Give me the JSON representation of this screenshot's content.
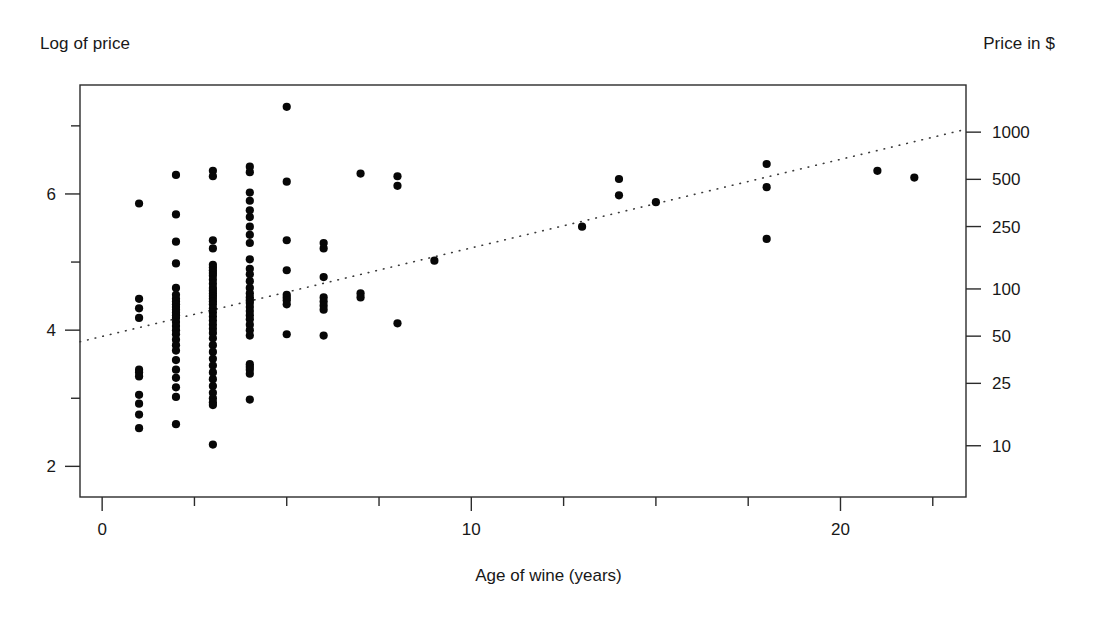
{
  "figure": {
    "left_corner_label": "Log of price",
    "right_corner_label": "Price in $",
    "x_axis_title": "Age of wine (years)"
  },
  "chart_data": {
    "type": "scatter",
    "title": "",
    "subtitle": "",
    "xlabel": "Age of wine (years)",
    "ylabel": "Log of price",
    "y2label": "Price in $",
    "xlim": [
      -0.6,
      23.4
    ],
    "ylim": [
      1.55,
      7.6
    ],
    "grid": false,
    "legend": null,
    "x_ticks": [
      0,
      10,
      20
    ],
    "x_ticklabels": [
      "0",
      "10",
      "20"
    ],
    "x_minor_ticks": [
      2.5,
      5,
      7.5,
      12.5,
      15,
      17.5,
      22.5
    ],
    "y_ticks": [
      2,
      4,
      6
    ],
    "y_ticklabels": [
      "2",
      "4",
      "6"
    ],
    "y_minor_ticks": [
      3,
      5,
      7
    ],
    "y2_ticks": [
      10,
      25,
      50,
      100,
      250,
      500,
      1000
    ],
    "y2_ticklabels": [
      "10",
      "25",
      "50",
      "100",
      "250",
      "500",
      "1000"
    ],
    "series": [
      {
        "name": "wines",
        "marker": "filled-circle",
        "color": "#070707",
        "x": [
          1,
          1,
          1,
          1,
          1,
          1,
          1,
          1,
          1,
          1,
          1,
          2,
          2,
          2,
          2,
          2,
          2,
          2,
          2,
          2,
          2,
          2,
          2,
          2,
          2,
          2,
          2,
          2,
          2,
          2,
          2,
          2,
          2,
          2,
          2,
          2,
          2,
          2,
          3,
          3,
          3,
          3,
          3,
          3,
          3,
          3,
          3,
          3,
          3,
          3,
          3,
          3,
          3,
          3,
          3,
          3,
          3,
          3,
          3,
          3,
          3,
          3,
          3,
          3,
          3,
          3,
          3,
          3,
          3,
          3,
          3,
          3,
          3,
          3,
          3,
          3,
          4,
          4,
          4,
          4,
          4,
          4,
          4,
          4,
          4,
          4,
          4,
          4,
          4,
          4,
          4,
          4,
          4,
          4,
          4,
          4,
          4,
          4,
          4,
          4,
          4,
          4,
          4,
          4,
          4,
          4,
          5,
          5,
          5,
          5,
          5,
          5,
          5,
          5,
          5,
          6,
          6,
          6,
          6,
          6,
          6,
          6,
          6,
          7,
          7,
          7,
          8,
          8,
          8,
          9,
          13,
          14,
          14,
          15,
          18,
          18,
          18,
          21,
          22
        ],
        "y": [
          5.86,
          4.46,
          4.32,
          4.18,
          3.42,
          3.38,
          3.32,
          3.05,
          2.92,
          2.76,
          2.56,
          6.28,
          5.7,
          5.3,
          4.98,
          4.62,
          4.52,
          4.46,
          4.42,
          4.38,
          4.34,
          4.3,
          4.26,
          4.22,
          4.18,
          4.12,
          4.06,
          4.0,
          3.94,
          3.86,
          3.78,
          3.7,
          3.56,
          3.42,
          3.3,
          3.16,
          3.02,
          2.62,
          6.34,
          6.26,
          5.32,
          5.2,
          4.96,
          4.92,
          4.88,
          4.84,
          4.8,
          4.74,
          4.68,
          4.62,
          4.58,
          4.54,
          4.5,
          4.46,
          4.42,
          4.38,
          4.32,
          4.26,
          4.2,
          4.14,
          4.08,
          4.02,
          3.96,
          3.88,
          3.78,
          3.68,
          3.58,
          3.48,
          3.38,
          3.28,
          3.18,
          3.08,
          3.0,
          2.94,
          2.9,
          2.32,
          6.4,
          6.32,
          6.02,
          5.9,
          5.76,
          5.66,
          5.52,
          5.4,
          5.28,
          5.04,
          4.9,
          4.82,
          4.72,
          4.62,
          4.54,
          4.48,
          4.44,
          4.4,
          4.34,
          4.28,
          4.22,
          4.16,
          4.08,
          4.0,
          3.92,
          3.5,
          3.46,
          3.42,
          3.36,
          2.98,
          7.28,
          6.18,
          5.32,
          4.88,
          4.52,
          4.48,
          4.44,
          4.38,
          3.94,
          5.28,
          5.2,
          4.78,
          4.48,
          4.42,
          4.36,
          4.3,
          3.92,
          6.3,
          4.54,
          4.48,
          6.26,
          6.12,
          4.1,
          5.02,
          5.52,
          6.22,
          5.98,
          5.88,
          6.44,
          6.1,
          5.34,
          6.34,
          6.24
        ]
      }
    ],
    "fit_line": {
      "name": "regression-fit",
      "style": "dotted",
      "color": "#3a3a3a",
      "x_start": -0.6,
      "y_start": 3.83,
      "x_end": 23.4,
      "y_end": 6.95
    }
  }
}
